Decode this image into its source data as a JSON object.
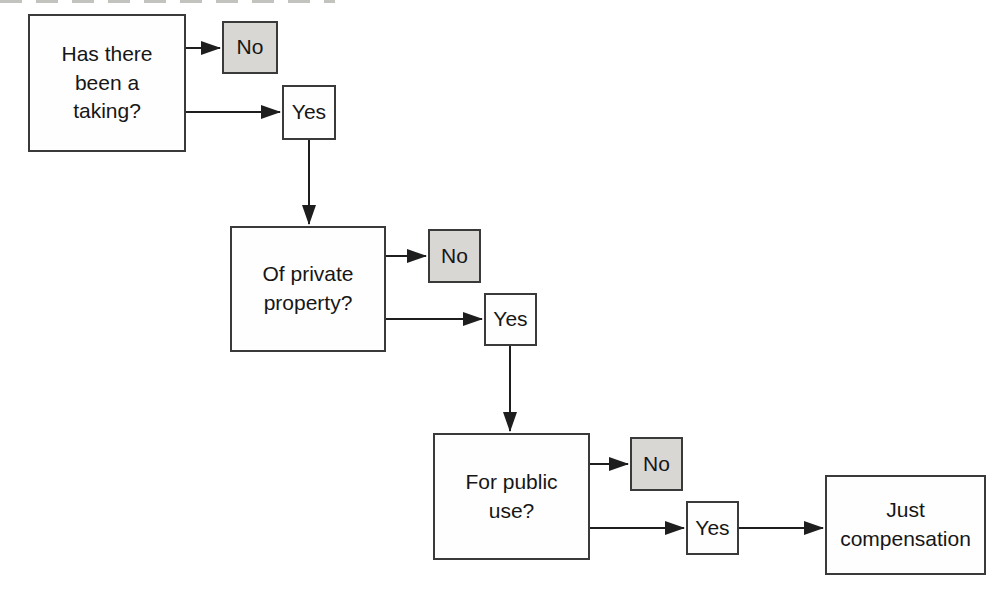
{
  "flowchart": {
    "nodes": {
      "q1": {
        "label": "Has there\nbeen a\ntaking?",
        "kind": "question"
      },
      "q1_no": {
        "label": "No",
        "kind": "terminal-no"
      },
      "q1_yes": {
        "label": "Yes",
        "kind": "continue-yes"
      },
      "q2": {
        "label": "Of private\nproperty?",
        "kind": "question"
      },
      "q2_no": {
        "label": "No",
        "kind": "terminal-no"
      },
      "q2_yes": {
        "label": "Yes",
        "kind": "continue-yes"
      },
      "q3": {
        "label": "For public\nuse?",
        "kind": "question"
      },
      "q3_no": {
        "label": "No",
        "kind": "terminal-no"
      },
      "q3_yes": {
        "label": "Yes",
        "kind": "continue-yes"
      },
      "result": {
        "label": "Just\ncompensation",
        "kind": "result"
      }
    },
    "edges": [
      {
        "from": "q1",
        "to": "q1_no"
      },
      {
        "from": "q1",
        "to": "q1_yes"
      },
      {
        "from": "q1_yes",
        "to": "q2"
      },
      {
        "from": "q2",
        "to": "q2_no"
      },
      {
        "from": "q2",
        "to": "q2_yes"
      },
      {
        "from": "q2_yes",
        "to": "q3"
      },
      {
        "from": "q3",
        "to": "q3_no"
      },
      {
        "from": "q3",
        "to": "q3_yes"
      },
      {
        "from": "q3_yes",
        "to": "result"
      }
    ],
    "colors": {
      "background": "#ffffff",
      "box_border": "#3a3a3a",
      "no_box_fill": "#d8d7d3",
      "yes_box_fill": "#fefefe",
      "arrow": "#1e1e1e",
      "text": "#161616"
    }
  }
}
